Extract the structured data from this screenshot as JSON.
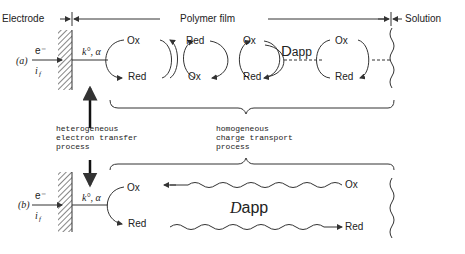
{
  "header": {
    "electrode": "Electrode",
    "polymer_film": "Polymer film",
    "solution": "Solution"
  },
  "panel_a": {
    "label": "(a)",
    "electron": "e⁻",
    "current": "i",
    "current_sub": "f",
    "rate": "k°, α",
    "cycles": [
      {
        "top": "Ox",
        "bottom": "Red"
      },
      {
        "top": "Red",
        "bottom": "Ox"
      },
      {
        "top": "Ox",
        "bottom": "Red"
      },
      {
        "top": "Ox",
        "bottom": "Red"
      }
    ],
    "diffusion": "D",
    "diffusion_sub": "app"
  },
  "middle": {
    "hetero": [
      "heterogeneous",
      "electron transfer",
      "process"
    ],
    "homo": [
      "homogeneous",
      "charge transport",
      "process"
    ]
  },
  "panel_b": {
    "label": "(b)",
    "electron": "e⁻",
    "current": "i",
    "current_sub": "f",
    "rate": "k°, α",
    "ox": "Ox",
    "red": "Red",
    "ox_right": "Ox",
    "red_right": "Red",
    "diffusion": "D",
    "diffusion_sub": "app"
  }
}
